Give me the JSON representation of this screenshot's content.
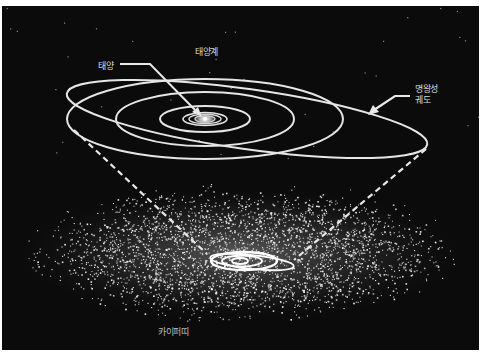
{
  "diagram": {
    "title": "태양계",
    "labels": {
      "solar_system": "태양계",
      "sun": "태양",
      "pluto_orbit_line1": "명왕성",
      "pluto_orbit_line2": "궤도",
      "kuiper_belt": "카이퍼띠"
    },
    "colors": {
      "background": "#0b0b0b",
      "orbit": "#e8e8e8",
      "particles": "#e0e0e0",
      "label": "#d8d8d8"
    },
    "elements": [
      {
        "name": "sun",
        "description": "central bright star with concentric inner planet orbits"
      },
      {
        "name": "planet-orbits",
        "count": 6
      },
      {
        "name": "pluto-orbit",
        "description": "tilted eccentric ellipse"
      },
      {
        "name": "kuiper-belt",
        "description": "disk of scattered small icy bodies surrounding a miniature solar system"
      },
      {
        "name": "projection-lines",
        "style": "dashed",
        "count": 2
      }
    ]
  }
}
